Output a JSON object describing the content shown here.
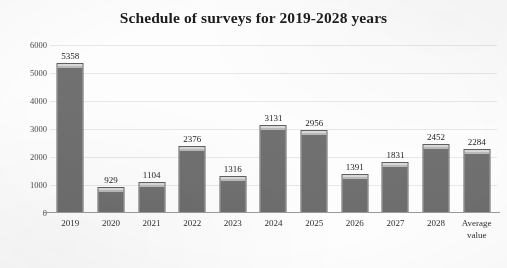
{
  "chart_data": {
    "type": "bar",
    "title": "Schedule of surveys for 2019-2028 years",
    "xlabel": "",
    "ylabel": "",
    "categories": [
      "2019",
      "2020",
      "2021",
      "2022",
      "2023",
      "2024",
      "2025",
      "2026",
      "2027",
      "2028",
      "Average value"
    ],
    "values": [
      5358,
      929,
      1104,
      2376,
      1316,
      3131,
      2956,
      1391,
      1831,
      2452,
      2284
    ],
    "data_labels": [
      "5358",
      "929",
      "1104",
      "2376",
      "1316",
      "3131",
      "2956",
      "1391",
      "1831",
      "2452",
      "2284"
    ],
    "ylim": [
      0,
      6000
    ],
    "yticks": [
      0,
      1000,
      2000,
      3000,
      4000,
      5000,
      6000
    ],
    "ytick_labels": [
      "0",
      "1000",
      "2000",
      "3000",
      "4000",
      "5000",
      "6000"
    ],
    "grid": true,
    "grid_axis": "y",
    "legend": false,
    "legend_position": "none",
    "bar_color": "#6d6d6d",
    "bar_edge_color": "#5f5f5f",
    "bar_highlight_color": "#d8d8d8",
    "gridline_color": "#e8e8e8",
    "axis_color": "#9a9a9a",
    "title_color": "#1d1d1d",
    "background_color": "#fdfdfd"
  }
}
